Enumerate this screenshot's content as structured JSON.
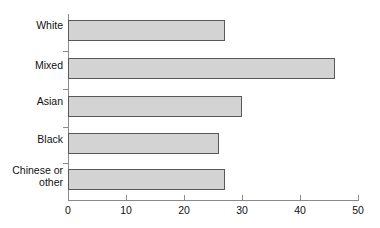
{
  "chart_data": {
    "type": "bar",
    "orientation": "horizontal",
    "title": "",
    "subtitle": "",
    "xlabel": "",
    "ylabel": "",
    "categories": [
      "White",
      "Mixed",
      "Asian",
      "Black",
      "Chinese or\nother"
    ],
    "values": [
      27,
      46,
      30,
      26,
      27
    ],
    "series": [
      {
        "name": "",
        "values": [
          27,
          46,
          30,
          26,
          27
        ]
      }
    ],
    "xlim": [
      0,
      50
    ],
    "xticks": [
      0,
      10,
      20,
      30,
      40,
      50
    ],
    "xtick_labels": [
      "0",
      "10",
      "20",
      "30",
      "40",
      "50"
    ],
    "grid": false,
    "legend": false,
    "legend_position": "none",
    "bar_fill_color": "#d3d3d3",
    "bar_border_color": "#595959",
    "axis_color": "#8a8a8a",
    "text_color": "#111111",
    "background_color": "#ffffff"
  }
}
